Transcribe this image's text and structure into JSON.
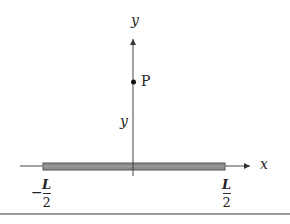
{
  "diagram": {
    "type": "physics-figure",
    "axes": {
      "x_label": "x",
      "y_label": "y"
    },
    "point": {
      "label": "P"
    },
    "distance_label": "y",
    "rod": {
      "left_end": {
        "sign": "−",
        "numerator": "L",
        "denominator": "2"
      },
      "right_end": {
        "numerator": "L",
        "denominator": "2"
      },
      "fill_color": "#8c8c8c",
      "stroke_color": "#555555"
    }
  }
}
